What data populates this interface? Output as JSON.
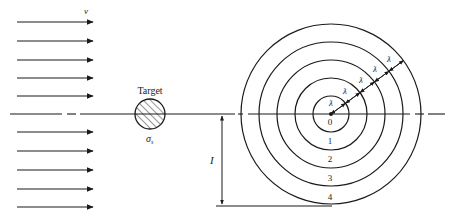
{
  "diagram": {
    "colors": {
      "ink": "#1a1a1a",
      "label": "#222222",
      "background": "#ffffff"
    },
    "beam": {
      "velocity_label": "v",
      "arrow_count": 10,
      "arrows_y": [
        22,
        41,
        60,
        78,
        96,
        132,
        151,
        170,
        189,
        207
      ]
    },
    "target": {
      "label": "Target",
      "cross_section_label": "σ",
      "cross_section_subscript": "s",
      "hatched": true
    },
    "impact_parameter": {
      "label": "I"
    },
    "rings": {
      "labels": [
        "0",
        "1",
        "2",
        "3",
        "4"
      ],
      "radii": [
        18,
        36,
        54,
        72,
        90
      ],
      "particle_symbol": "ƛ"
    }
  }
}
